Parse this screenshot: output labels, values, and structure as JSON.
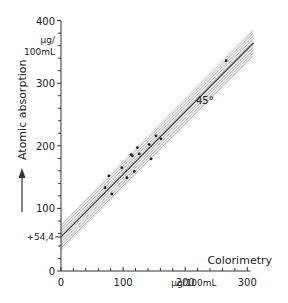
{
  "chart_data": {
    "type": "scatter",
    "title": "",
    "xlabel": "Colorimetry",
    "x_unit": "µg/100mL",
    "ylabel": "Atomic absorption",
    "y_unit_line1": "µg/",
    "y_unit_line2": "100mL",
    "xlim": [
      0,
      300
    ],
    "ylim": [
      0,
      400
    ],
    "x_ticks": [
      "0",
      "100",
      "200",
      "300"
    ],
    "y_ticks": [
      "0",
      "100",
      "200",
      "300",
      "400"
    ],
    "intercept_label": "+54,4",
    "line_label": "45°",
    "grid": false,
    "legend": null,
    "regression": {
      "intercept": 54.4,
      "slope": 1.0
    },
    "points": [
      {
        "x": 71,
        "y": 133
      },
      {
        "x": 77,
        "y": 152
      },
      {
        "x": 82,
        "y": 123
      },
      {
        "x": 98,
        "y": 165
      },
      {
        "x": 106,
        "y": 149
      },
      {
        "x": 113,
        "y": 186
      },
      {
        "x": 115,
        "y": 184
      },
      {
        "x": 118,
        "y": 159
      },
      {
        "x": 123,
        "y": 197
      },
      {
        "x": 126,
        "y": 187
      },
      {
        "x": 145,
        "y": 179
      },
      {
        "x": 142,
        "y": 202
      },
      {
        "x": 153,
        "y": 216
      },
      {
        "x": 161,
        "y": 211
      },
      {
        "x": 266,
        "y": 336
      }
    ]
  }
}
